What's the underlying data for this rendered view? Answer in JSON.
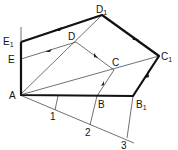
{
  "diagram": {
    "type": "geometric-construction",
    "points": {
      "A": [
        20,
        95
      ],
      "B": [
        97,
        96
      ],
      "B1": [
        133,
        96
      ],
      "C": [
        114,
        70
      ],
      "C1": [
        159,
        56
      ],
      "D": [
        76,
        42
      ],
      "D1": [
        102,
        15
      ],
      "E": [
        21,
        59
      ],
      "E1": [
        21,
        42
      ],
      "P1": [
        55,
        110
      ],
      "P2": [
        90,
        125
      ],
      "P3": [
        127,
        138
      ]
    },
    "labels": {
      "A": "A",
      "B": "B",
      "B1_main": "B",
      "B1_sub": "1",
      "C": "C",
      "C1_main": "C",
      "C1_sub": "1",
      "D": "D",
      "D1_main": "D",
      "D1_sub": "1",
      "E": "E",
      "E1_main": "E",
      "E1_sub": "1",
      "n1": "1",
      "n2": "2",
      "n3": "3"
    },
    "colors": {
      "line": "#333333",
      "thick": "#111111",
      "background": "#ffffff"
    }
  }
}
